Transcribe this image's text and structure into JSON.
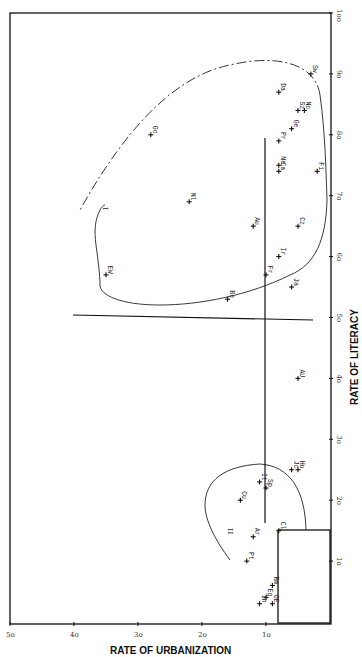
{
  "chart_data": {
    "type": "scatter",
    "orientation": "rotated 90 degrees (page printed sideways)",
    "xlabel": "RATE OF URBANIZATION",
    "ylabel": "RATE OF LITERACY",
    "xlim": [
      50,
      0
    ],
    "ylim": [
      0,
      100
    ],
    "x_ticks": [
      "5o",
      "4o",
      "3o",
      "2o",
      "1o"
    ],
    "x_tick_values": [
      50,
      40,
      30,
      20,
      10
    ],
    "y_ticks": [
      "1o",
      "2o",
      "3o",
      "4o",
      "5o",
      "6o",
      "7o",
      "8o",
      "9o",
      "1oo"
    ],
    "y_tick_values": [
      10,
      20,
      30,
      40,
      50,
      60,
      70,
      80,
      90,
      100
    ],
    "grid": false,
    "legend": null,
    "region_labels": [
      "I",
      "II"
    ],
    "reference_lines": [
      {
        "name": "literacy-50-line",
        "description": "long line near literacy 50 spanning urbanization ~42 to ~7"
      },
      {
        "name": "urbanization-10-line",
        "description": "line at urbanization ~10 spanning literacy ~17 to ~79"
      }
    ],
    "points": [
      {
        "label": "Sw",
        "urbanization": 3,
        "literacy": 90
      },
      {
        "label": "Da",
        "urbanization": 8,
        "literacy": 87
      },
      {
        "label": "Sz",
        "urbanization": 5,
        "literacy": 84
      },
      {
        "label": "No",
        "urbanization": 4,
        "literacy": 84
      },
      {
        "label": "Ge",
        "urbanization": 6,
        "literacy": 81
      },
      {
        "label": "Pr",
        "urbanization": 8,
        "literacy": 79
      },
      {
        "label": "Go",
        "urbanization": 28,
        "literacy": 80
      },
      {
        "label": "Ne",
        "urbanization": 8,
        "literacy": 75
      },
      {
        "label": "Ca",
        "urbanization": 8,
        "literacy": 74
      },
      {
        "label": "Fi",
        "urbanization": 2,
        "literacy": 74
      },
      {
        "label": "Nl",
        "urbanization": 22,
        "literacy": 69
      },
      {
        "label": "Au",
        "urbanization": 12,
        "literacy": 65
      },
      {
        "label": "Cz",
        "urbanization": 5,
        "literacy": 65
      },
      {
        "label": "EW",
        "urbanization": 35,
        "literacy": 57
      },
      {
        "label": "Fr",
        "urbanization": 10,
        "literacy": 57
      },
      {
        "label": "Ir",
        "urbanization": 8,
        "literacy": 60
      },
      {
        "label": "Be",
        "urbanization": 16,
        "literacy": 53
      },
      {
        "label": "Ja",
        "urbanization": 6,
        "literacy": 55
      },
      {
        "label": "AU",
        "urbanization": 5,
        "literacy": 40
      },
      {
        "label": "Jc",
        "urbanization": 6,
        "literacy": 25
      },
      {
        "label": "Hu",
        "urbanization": 5,
        "literacy": 25
      },
      {
        "label": "It",
        "urbanization": 11,
        "literacy": 23
      },
      {
        "label": "Sp",
        "urbanization": 10,
        "literacy": 22
      },
      {
        "label": "Cu",
        "urbanization": 14,
        "literacy": 20
      },
      {
        "label": "Ar",
        "urbanization": 12,
        "literacy": 14
      },
      {
        "label": "Cl",
        "urbanization": 8,
        "literacy": 15
      },
      {
        "label": "Pt",
        "urbanization": 13,
        "literacy": 10
      },
      {
        "label": "Rm",
        "urbanization": 9,
        "literacy": 6
      },
      {
        "label": "Eg",
        "urbanization": 10,
        "literacy": 4
      },
      {
        "label": "In",
        "urbanization": 11,
        "literacy": 3
      },
      {
        "label": "OE",
        "urbanization": 9,
        "literacy": 3
      }
    ]
  },
  "axes": {
    "bottom_title": "RATE OF URBANIZATION",
    "right_title": "RATE OF LITERACY"
  },
  "regions": {
    "cluster_one_label": "I",
    "cluster_two_label": "II"
  }
}
